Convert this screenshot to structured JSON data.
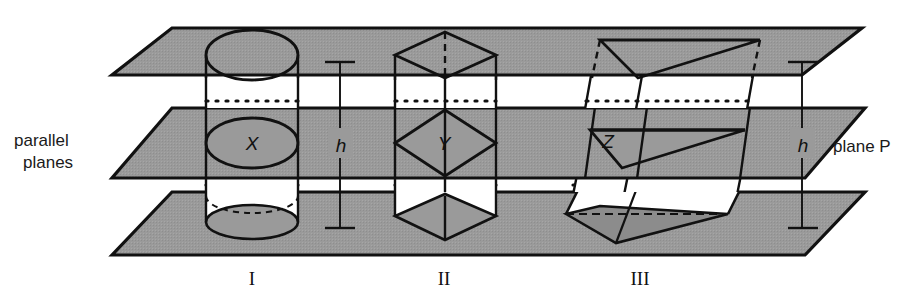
{
  "figure": {
    "title_alt": "Three solids of equal height h between parallel planes cut by plane P",
    "colors": {
      "plane_fill": "#9a9a9a",
      "plane_fill_dark": "#8c8c8c",
      "solid_fill": "#ffffff",
      "cross_section_fill": "#9a9a9a",
      "outline": "#111111",
      "background": "#ffffff"
    },
    "labels": {
      "parallel_planes_line1": "parallel",
      "parallel_planes_line2": "planes",
      "plane_p": "plane P",
      "height_left": "h",
      "height_right": "h",
      "cross_section_1": "X",
      "cross_section_2": "Y",
      "cross_section_3": "Z",
      "figure_1": "I",
      "figure_2": "II",
      "figure_3": "III"
    },
    "planes": [
      {
        "name": "top-plane",
        "y_back": 28,
        "y_front": 75
      },
      {
        "name": "middle-plane",
        "y_back": 108,
        "y_front": 178,
        "label": "plane P"
      },
      {
        "name": "bottom-plane",
        "y_back": 192,
        "y_front": 255
      }
    ],
    "solids": [
      {
        "id": "I",
        "name": "cylinder",
        "cross_section": "X",
        "cross_section_shape": "ellipse"
      },
      {
        "id": "II",
        "name": "rectangular-prism",
        "cross_section": "Y",
        "cross_section_shape": "rhombus"
      },
      {
        "id": "III",
        "name": "oblique-prism",
        "cross_section": "Z",
        "cross_section_shape": "triangle"
      }
    ]
  }
}
